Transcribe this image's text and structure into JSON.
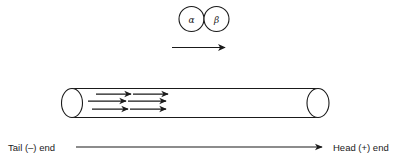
{
  "figure": {
    "title_text": "",
    "background_color": "#ffffff",
    "stroke_color": "#1a1a1a",
    "subunits": {
      "alpha_label": "α",
      "beta_label": "β",
      "alpha_name": "alpha-tubulin-subunit",
      "beta_name": "beta-tubulin-subunit",
      "dimer_arrow_name": "dimer-direction-arrow"
    },
    "filament": {
      "name": "microtubule-cylinder",
      "internal_arrow_count": 6,
      "internal_arrow_rows": 3,
      "internal_arrows_per_row": 2
    },
    "polarity_axis": {
      "left_label": "Tail (–) end",
      "right_label": "Head (+) end",
      "arrow_direction": "right"
    }
  }
}
